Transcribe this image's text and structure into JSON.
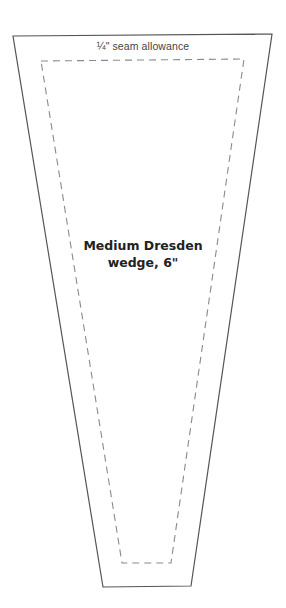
{
  "diagram": {
    "seam_label": "¼\" seam allowance",
    "template_label_line1": "Medium Dresden",
    "template_label_line2": "wedge, 6\"",
    "colors": {
      "background": "#ffffff",
      "cut_line": "#555555",
      "seam_line": "#8a8a8a",
      "text": "#222222"
    },
    "cut_line_points": "13,36 272,34 191,586 103,587",
    "seam_line_points": "41,61 244,59 171,563 122,563"
  }
}
